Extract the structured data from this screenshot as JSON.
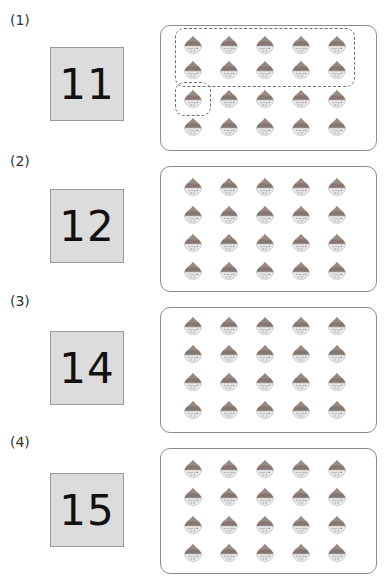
{
  "problems": [
    {
      "label": "(1)",
      "number": "11",
      "rows": 4,
      "cols": 5,
      "groups": [
        {
          "name": "ten-group",
          "rows": [
            0,
            1
          ],
          "cols": [
            0,
            4
          ]
        },
        {
          "name": "one-group",
          "rows": [
            2,
            2
          ],
          "cols": [
            0,
            0
          ]
        }
      ]
    },
    {
      "label": "(2)",
      "number": "12",
      "rows": 4,
      "cols": 5,
      "groups": []
    },
    {
      "label": "(3)",
      "number": "14",
      "rows": 4,
      "cols": 5,
      "groups": []
    },
    {
      "label": "(4)",
      "number": "15",
      "rows": 4,
      "cols": 5,
      "groups": []
    }
  ],
  "item_icon": "chestnut-icon",
  "colors": {
    "cap": "#857670",
    "bowl": "#e4e4e4",
    "box_fill": "#dcdcdc"
  }
}
